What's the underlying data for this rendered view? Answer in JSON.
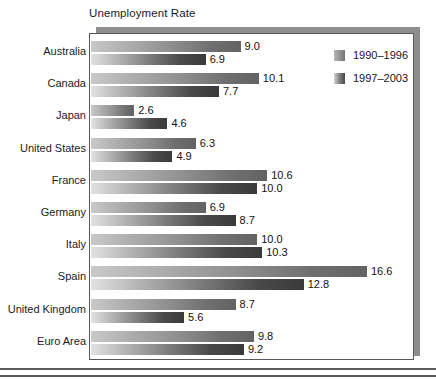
{
  "chart_data": {
    "type": "bar",
    "orientation": "horizontal",
    "title": "Unemployment Rate",
    "xlabel": "",
    "ylabel": "",
    "grid": false,
    "legend_position": "top-right",
    "xlim": [
      0,
      19.3
    ],
    "categories": [
      "Australia",
      "Canada",
      "Japan",
      "United States",
      "France",
      "Germany",
      "Italy",
      "Spain",
      "United Kingdom",
      "Euro Area"
    ],
    "series": [
      {
        "name": "1990–1996",
        "values": [
          9.0,
          10.1,
          2.6,
          6.3,
          10.6,
          6.9,
          10.0,
          16.6,
          8.7,
          9.8
        ],
        "labels": [
          "9.0",
          "10.1",
          "2.6",
          "6.3",
          "10.6",
          "6.9",
          "10.0",
          "16.6",
          "8.7",
          "9.8"
        ]
      },
      {
        "name": "1997–2003",
        "values": [
          6.9,
          7.7,
          4.6,
          4.9,
          10.0,
          8.7,
          10.3,
          12.8,
          5.6,
          9.2
        ],
        "labels": [
          "6.9",
          "7.7",
          "4.6",
          "4.9",
          "10.0",
          "8.7",
          "10.3",
          "12.8",
          "5.6",
          "9.2"
        ]
      }
    ]
  },
  "legend": {
    "items": [
      {
        "label": "1990–1996",
        "swatch": "gradient-gray-dark"
      },
      {
        "label": "1997–2003",
        "swatch": "gradient-gray-darker"
      }
    ]
  },
  "colors": {
    "frame_border": "#585858",
    "shadow": "#8e8e8e",
    "text": "#1b1b1b",
    "rule": "#5a5a5a",
    "series1_start": "#c9c9c9",
    "series1_end": "#636363",
    "series2_start": "#e2e2e2",
    "series2_end": "#3a3a3a"
  }
}
